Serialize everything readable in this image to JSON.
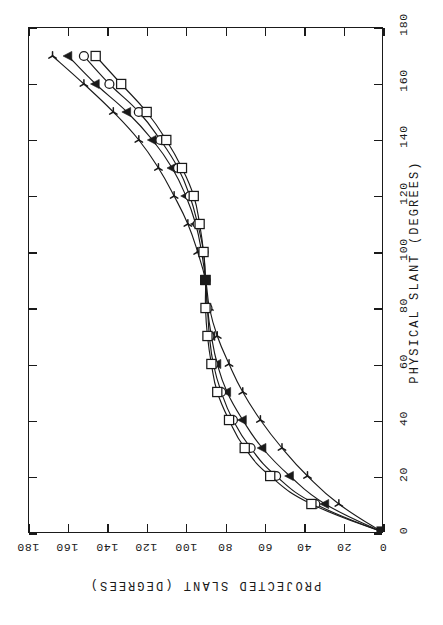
{
  "figure": {
    "background_color": "#ffffff",
    "ink_color": "#1a1a1a",
    "orientation_note": "landscape figure rotated; physical-slant axis runs bottom-to-top at right, projected-slant axis runs right-to-left along bottom"
  },
  "axes": {
    "bottom": {
      "name": "projected-slant-axis",
      "title": "PROJECTED SLANT (DEGREES)",
      "ticks": [
        "180",
        "160",
        "140",
        "120",
        "100",
        "80",
        "60",
        "40",
        "20",
        "0"
      ],
      "min": 0,
      "max": 180,
      "direction": "right-to-left"
    },
    "right": {
      "name": "physical-slant-axis",
      "title": "PHYSICAL SLANT (DEGREES)",
      "ticks": [
        "180",
        "160",
        "140",
        "120",
        "100",
        "80",
        "60",
        "40",
        "20",
        "0"
      ],
      "min": 0,
      "max": 180,
      "direction": "bottom-to-top"
    }
  },
  "chart_data": {
    "type": "line",
    "title": "",
    "xlabel": "PHYSICAL SLANT (DEGREES)",
    "ylabel": "PROJECTED SLANT (DEGREES)",
    "xlim": [
      0,
      180
    ],
    "ylim": [
      0,
      180
    ],
    "xticks": [
      0,
      20,
      40,
      60,
      80,
      100,
      120,
      140,
      160,
      180
    ],
    "yticks": [
      0,
      20,
      40,
      60,
      80,
      100,
      120,
      140,
      160,
      180
    ],
    "grid": false,
    "legend": "none",
    "x": [
      0,
      10,
      20,
      30,
      40,
      50,
      60,
      70,
      80,
      90,
      100,
      110,
      120,
      130,
      140,
      150,
      160,
      170
    ],
    "series": [
      {
        "name": "star",
        "marker": "star-marker",
        "values": [
          0,
          22,
          38,
          51,
          62,
          71,
          78,
          84,
          88,
          90,
          94,
          99,
          106,
          114,
          124,
          137,
          152,
          168
        ]
      },
      {
        "name": "triangle",
        "marker": "triangle-marker",
        "values": [
          0,
          29,
          47,
          61,
          71,
          79,
          84,
          87,
          89,
          90,
          92,
          95,
          100,
          107,
          117,
          130,
          146,
          160
        ]
      },
      {
        "name": "circle",
        "marker": "circle-marker",
        "values": [
          0,
          34,
          54,
          67,
          76,
          82,
          86,
          88,
          89,
          90,
          91,
          94,
          98,
          104,
          113,
          124,
          139,
          152
        ]
      },
      {
        "name": "square",
        "marker": "square-marker",
        "values": [
          0,
          36,
          57,
          70,
          78,
          84,
          87,
          89,
          90,
          90,
          91,
          93,
          96,
          102,
          110,
          120,
          133,
          146
        ]
      }
    ]
  }
}
